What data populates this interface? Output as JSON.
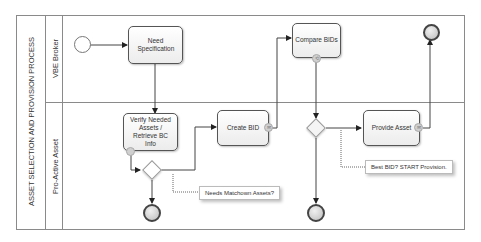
{
  "diagram": {
    "type": "BPMN process",
    "pool": {
      "label": "ASSET SELECTION AND PROVISION PROCESS"
    },
    "lanes": [
      {
        "id": "vbe-broker",
        "label": "VBE Broker"
      },
      {
        "id": "pro-active-asset",
        "label": "Pro-Active Asset"
      }
    ],
    "tasks": [
      {
        "id": "need-spec",
        "label": "Need Specification",
        "lane": "vbe-broker"
      },
      {
        "id": "compare-bids",
        "label": "Compare BIDs",
        "lane": "vbe-broker",
        "marker": "loop"
      },
      {
        "id": "verify-assets",
        "label": "Verify Needed Assets / Retrieve BC Info",
        "lane": "pro-active-asset",
        "marker": "boundary"
      },
      {
        "id": "create-bid",
        "label": "Create BID",
        "lane": "pro-active-asset",
        "marker": "message"
      },
      {
        "id": "provide-asset",
        "label": "Provide Asset",
        "lane": "pro-active-asset",
        "marker": "message"
      }
    ],
    "gateways": [
      {
        "id": "gw-match",
        "type": "exclusive",
        "lane": "pro-active-asset"
      },
      {
        "id": "gw-best",
        "type": "exclusive",
        "lane": "pro-active-asset"
      }
    ],
    "events": [
      {
        "id": "start",
        "type": "start",
        "lane": "vbe-broker"
      },
      {
        "id": "end-broker",
        "type": "end",
        "lane": "vbe-broker"
      },
      {
        "id": "end-match",
        "type": "end",
        "lane": "pro-active-asset"
      },
      {
        "id": "end-best",
        "type": "end",
        "lane": "pro-active-asset"
      }
    ],
    "annotations": [
      {
        "id": "ann-match",
        "text": "Needs Matchown Assets?"
      },
      {
        "id": "ann-best",
        "text": "Best BID? START Provision."
      }
    ]
  }
}
